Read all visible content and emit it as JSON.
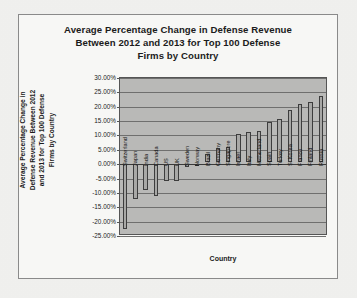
{
  "chart_data": {
    "type": "bar",
    "title": "Average Percentage Change in Defense Revenue Between 2012 and 2013 for Top 100 Defense Firms by Country",
    "title_lines": [
      "Average Percentage Change in Defense Revenue",
      "Between 2012 and 2013 for Top 100 Defense",
      "Firms by Country"
    ],
    "xlabel": "Country",
    "ylabel": "Average Percentage Change in Defense Revenue Between 2012 and 2013 for Top 100 Defense Firms by Country",
    "ylabel_lines": [
      "Average Percentage Change in",
      "Defense Revenue Between 2012",
      "and 2013 for Top 100 Defense",
      "Firms by Country"
    ],
    "ylim": [
      -25,
      30
    ],
    "ytick_step": 5,
    "ytick_labels": [
      "30.00%",
      "25.00%",
      "20.00%",
      "15.00%",
      "10.00%",
      "5.00%",
      "0.00%",
      "-5.00%",
      "-10.00%",
      "-15.00%",
      "-20.00%",
      "-25.00%"
    ],
    "ytick_values": [
      30,
      25,
      20,
      15,
      10,
      5,
      0,
      -5,
      -10,
      -15,
      -20,
      -25
    ],
    "grid": true,
    "legend": false,
    "categories": [
      "Switzerland",
      "Japan",
      "India",
      "Canada",
      "US",
      "UK",
      "Sweden",
      "Norway",
      "Brazil",
      "Germany",
      "Singapore",
      "Israel",
      "Italy",
      "Netherland",
      "Spain",
      "Turkey",
      "S. Korea",
      "France",
      "Finland",
      "Russia"
    ],
    "values": [
      -22.5,
      -12.0,
      -9.0,
      -11.0,
      -6.0,
      -6.0,
      -1.0,
      -0.5,
      3.0,
      5.0,
      5.2,
      9.7,
      10.4,
      11.0,
      14.0,
      15.0,
      18.0,
      20.3,
      21.0,
      23.2
    ],
    "colors": {
      "bar_fill": "#a8a8a6",
      "bar_border": "#3d3d3d",
      "plot_background": "#b9b9b7",
      "gridline": "#6f6f6e",
      "frame_border": "#8a8a8a",
      "chart_background": "#f7f7f5",
      "page_background": "#f2f2f0",
      "text": "#1b1b1b"
    }
  },
  "artifacts": {
    "ghost_line_1": "Average Percentage Change in Defense Revenue",
    "ghost_line_2": "by Country"
  }
}
